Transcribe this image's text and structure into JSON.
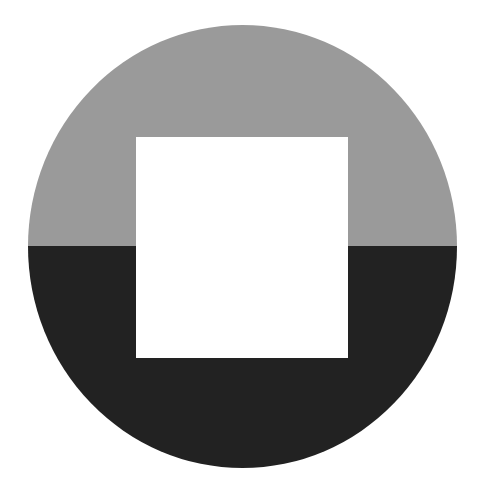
{
  "figure": {
    "shape": "circle-with-square-cutout",
    "colors": {
      "background": "#ffffff",
      "upper_half": "#9a9a9a",
      "lower_half": "#222222",
      "square": "#ffffff"
    }
  }
}
